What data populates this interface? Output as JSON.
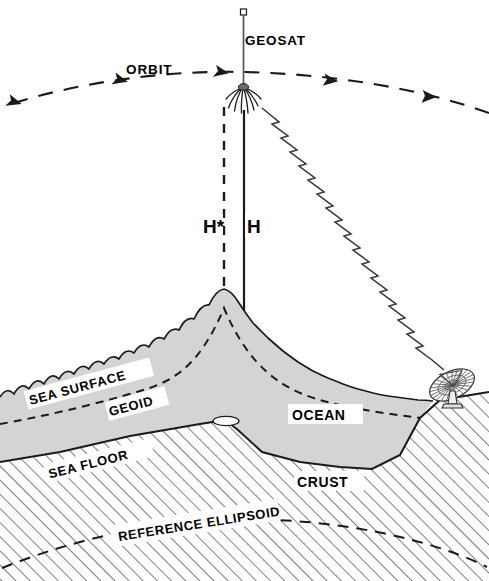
{
  "figure": {
    "background_color": "#ffffff",
    "line_color": "#1a1a1a",
    "ocean_fill": "#d4d4d4",
    "crust_fill": "#ffffff",
    "hatch_color": "#5a5a5a"
  },
  "labels": {
    "satellite": "GEOSAT",
    "orbit": "ORBIT",
    "height_star": "H*",
    "height": "H",
    "sea_surface": "SEA  SURFACE",
    "geoid": "GEOID",
    "ocean": "OCEAN",
    "sea_floor": "SEA  FLOOR",
    "crust": "CRUST",
    "reference_ellipsoid": "REFERENCE   ELLIPSOID"
  },
  "elements": {
    "satellite_icon": "geosat-satellite",
    "ground_station_icon": "parabolic-dish-antenna",
    "signal_icon": "zigzag-radio-beam",
    "orbit_arrows": 5
  }
}
